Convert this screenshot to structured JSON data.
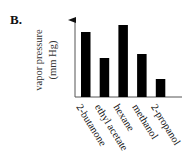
{
  "panel_label": "B.",
  "chart_data": {
    "type": "bar",
    "title": "",
    "xlabel": "",
    "ylabel": "vapor pressure",
    "ylabel_units": "(mm Hg)",
    "categories": [
      "2-butanone",
      "ethyl acetate",
      "hexane",
      "methanol",
      "2-propanol"
    ],
    "values": [
      65,
      39,
      72,
      43,
      18
    ],
    "value_units": "relative (no numeric scale shown)",
    "ylim": [
      0,
      79
    ],
    "y_axis_arrow": true,
    "grid": false,
    "legend": "none",
    "bar_color": "#000000"
  }
}
